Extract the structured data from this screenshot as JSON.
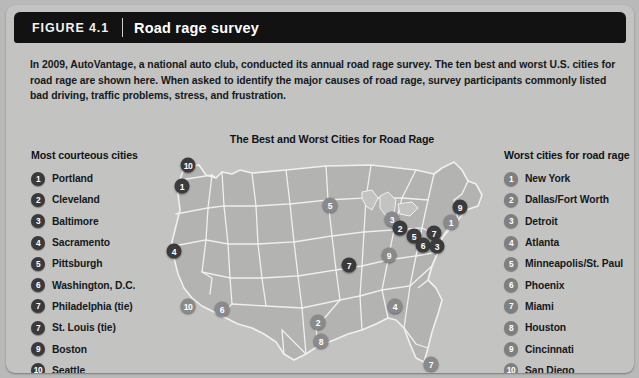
{
  "header": {
    "figure_label": "FIGURE 4.1",
    "title": "Road rage survey"
  },
  "intro": {
    "text": "In 2009, AutoVantage, a national auto club, conducted its annual road rage survey. The ten best and worst U.S. cities for road rage are shown here. When asked to identify the major causes of road rage, survey participants commonly listed bad driving, traffic problems, stress, and frustration."
  },
  "left_column": {
    "heading": "Most courteous cities",
    "items": [
      {
        "rank": "1",
        "city": "Portland"
      },
      {
        "rank": "2",
        "city": "Cleveland"
      },
      {
        "rank": "3",
        "city": "Baltimore"
      },
      {
        "rank": "4",
        "city": "Sacramento"
      },
      {
        "rank": "5",
        "city": "Pittsburgh"
      },
      {
        "rank": "6",
        "city": "Washington, D.C."
      },
      {
        "rank": "7",
        "city": "Philadelphia (tie)"
      },
      {
        "rank": "7",
        "city": "St. Louis (tie)"
      },
      {
        "rank": "9",
        "city": "Boston"
      },
      {
        "rank": "10",
        "city": "Seattle"
      }
    ]
  },
  "right_column": {
    "heading": "Worst cities for road rage",
    "items": [
      {
        "rank": "1",
        "city": "New York"
      },
      {
        "rank": "2",
        "city": "Dallas/Fort Worth"
      },
      {
        "rank": "3",
        "city": "Detroit"
      },
      {
        "rank": "4",
        "city": "Atlanta"
      },
      {
        "rank": "5",
        "city": "Minneapolis/St. Paul"
      },
      {
        "rank": "6",
        "city": "Phoenix"
      },
      {
        "rank": "7",
        "city": "Miami"
      },
      {
        "rank": "8",
        "city": "Houston"
      },
      {
        "rank": "9",
        "city": "Cincinnati"
      },
      {
        "rank": "10",
        "city": "San Diego"
      }
    ]
  },
  "map": {
    "title": "The Best and Worst Cities for Road Rage",
    "markers": [
      {
        "rank": "10",
        "city": "Seattle",
        "group": "courteous",
        "x": 22,
        "y": 17
      },
      {
        "rank": "1",
        "city": "Portland",
        "group": "courteous",
        "x": 16,
        "y": 38
      },
      {
        "rank": "4",
        "city": "Sacramento",
        "group": "courteous",
        "x": 8,
        "y": 103
      },
      {
        "rank": "10",
        "city": "San Diego",
        "group": "worst",
        "x": 22,
        "y": 158
      },
      {
        "rank": "6",
        "city": "Phoenix",
        "group": "worst",
        "x": 56,
        "y": 161
      },
      {
        "rank": "2",
        "city": "Dallas/Fort Worth",
        "group": "worst",
        "x": 152,
        "y": 174
      },
      {
        "rank": "8",
        "city": "Houston",
        "group": "worst",
        "x": 155,
        "y": 193
      },
      {
        "rank": "5",
        "city": "Minneapolis/St. Paul",
        "group": "worst",
        "x": 164,
        "y": 57
      },
      {
        "rank": "7",
        "city": "St. Louis",
        "group": "courteous",
        "x": 183,
        "y": 117
      },
      {
        "rank": "9",
        "city": "Cincinnati",
        "group": "worst",
        "x": 223,
        "y": 107
      },
      {
        "rank": "3",
        "city": "Detroit",
        "group": "worst",
        "x": 226,
        "y": 71
      },
      {
        "rank": "2",
        "city": "Cleveland",
        "group": "courteous",
        "x": 234,
        "y": 80
      },
      {
        "rank": "5",
        "city": "Pittsburgh",
        "group": "courteous",
        "x": 248,
        "y": 88
      },
      {
        "rank": "6",
        "city": "Washington, D.C.",
        "group": "courteous",
        "x": 257,
        "y": 97
      },
      {
        "rank": "7",
        "city": "Philadelphia",
        "group": "courteous",
        "x": 268,
        "y": 85
      },
      {
        "rank": "3",
        "city": "Baltimore",
        "group": "courteous",
        "x": 271,
        "y": 98
      },
      {
        "rank": "1",
        "city": "New York",
        "group": "worst",
        "x": 285,
        "y": 74
      },
      {
        "rank": "9",
        "city": "Boston",
        "group": "courteous",
        "x": 294,
        "y": 59
      },
      {
        "rank": "4",
        "city": "Atlanta",
        "group": "worst",
        "x": 229,
        "y": 158
      },
      {
        "rank": "7",
        "city": "Miami",
        "group": "worst",
        "x": 265,
        "y": 216
      }
    ]
  },
  "colors": {
    "panel_background": "#c3c3c2",
    "header_background": "#121212",
    "badge_dark": "#3a3a3c",
    "badge_light": "#7f7f81",
    "map_land": "#b3b3b2",
    "map_border": "#f0f0ef"
  }
}
